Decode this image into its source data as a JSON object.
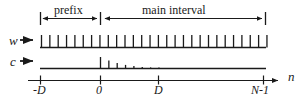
{
  "figure": {
    "ink_color": "#1a1a1a",
    "background_color": "#ffffff",
    "spans": [
      {
        "id": "prefix",
        "label": "prefix",
        "x_start": 40,
        "x_end": 100,
        "label_x": 52,
        "label_y": 8
      },
      {
        "id": "main-interval",
        "label": "main interval",
        "x_start": 102,
        "x_end": 265,
        "label_x": 140,
        "label_y": 8
      }
    ],
    "rows": [
      {
        "id": "w",
        "label": "w",
        "label_x": 9,
        "label_y": 34,
        "arrow_x_start": 20,
        "arrow_x_end": 35,
        "arrow_y": 40,
        "baseline_y": 48,
        "line_x_start": 40,
        "line_x_end": 266,
        "tick_start_x": 41,
        "tick_spacing": 8.35,
        "tick_count": 28,
        "tick_height": 13,
        "tick_decay": false
      },
      {
        "id": "c",
        "label": "c",
        "label_x": 10,
        "label_y": 56,
        "arrow_x_start": 20,
        "arrow_x_end": 35,
        "arrow_y": 61,
        "baseline_y": 69,
        "line_x_start": 40,
        "line_x_end": 266,
        "tick_start_x": 100,
        "tick_spacing": 8.35,
        "tick_count": 8,
        "tick_height": 12,
        "tick_decay": true
      }
    ],
    "axis": {
      "id": "n-axis",
      "label": "n",
      "label_x": 288,
      "label_y": 72,
      "y": 80,
      "x_start": 28,
      "x_end": 282,
      "ticks": [
        {
          "label": "-D",
          "x": 40,
          "label_x": 33,
          "label_y": 85
        },
        {
          "label": "0",
          "x": 100,
          "label_x": 96,
          "label_y": 85
        },
        {
          "label": "D",
          "x": 158,
          "label_x": 154,
          "label_y": 85
        },
        {
          "label": "N-1",
          "x": 263,
          "label_x": 252,
          "label_y": 85
        }
      ]
    }
  }
}
